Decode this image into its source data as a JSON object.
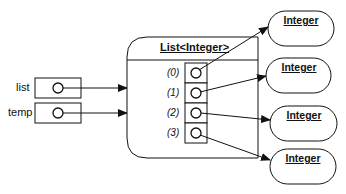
{
  "diagram": {
    "variables": [
      {
        "name": "list"
      },
      {
        "name": "temp"
      }
    ],
    "container": {
      "title": "List<Integer>",
      "indices": [
        "(0)",
        "(1)",
        "(2)",
        "(3)"
      ]
    },
    "objects": [
      {
        "label": "Integer"
      },
      {
        "label": "Integer"
      },
      {
        "label": "Integer"
      },
      {
        "label": "Integer"
      }
    ],
    "colors": {
      "stroke": "#111111",
      "background": "#ffffff"
    }
  }
}
